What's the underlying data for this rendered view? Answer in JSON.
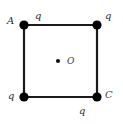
{
  "figure": {
    "colors": {
      "stroke": "#1a1a1a",
      "vertex_fill": "#000000",
      "label": "#2b2b2b",
      "background": "#ffffff"
    },
    "square": {
      "left": 24,
      "top": 25,
      "right": 97,
      "bottom": 97,
      "side_px": 73,
      "stroke_width": 2
    },
    "vertices": [
      {
        "id": "top-left",
        "x": 24,
        "y": 25,
        "radius": 4.5,
        "corner_label": "A",
        "charge_label": "q"
      },
      {
        "id": "top-right",
        "x": 97,
        "y": 25,
        "radius": 4.5,
        "corner_label": "",
        "charge_label": "q"
      },
      {
        "id": "bottom-left",
        "x": 24,
        "y": 97,
        "radius": 4.5,
        "corner_label": "",
        "charge_label": "q"
      },
      {
        "id": "bottom-right",
        "x": 97,
        "y": 97,
        "radius": 4.5,
        "corner_label": "C",
        "charge_label": "q"
      }
    ],
    "center": {
      "x": 58,
      "y": 61,
      "radius": 2,
      "label": "O"
    },
    "labels": {
      "vertex_A": "A",
      "vertex_C": "C",
      "center_O": "O",
      "charge_top": "q",
      "charge_top_right": "q",
      "charge_bottom_left": "q",
      "charge_bottom": "q"
    }
  }
}
